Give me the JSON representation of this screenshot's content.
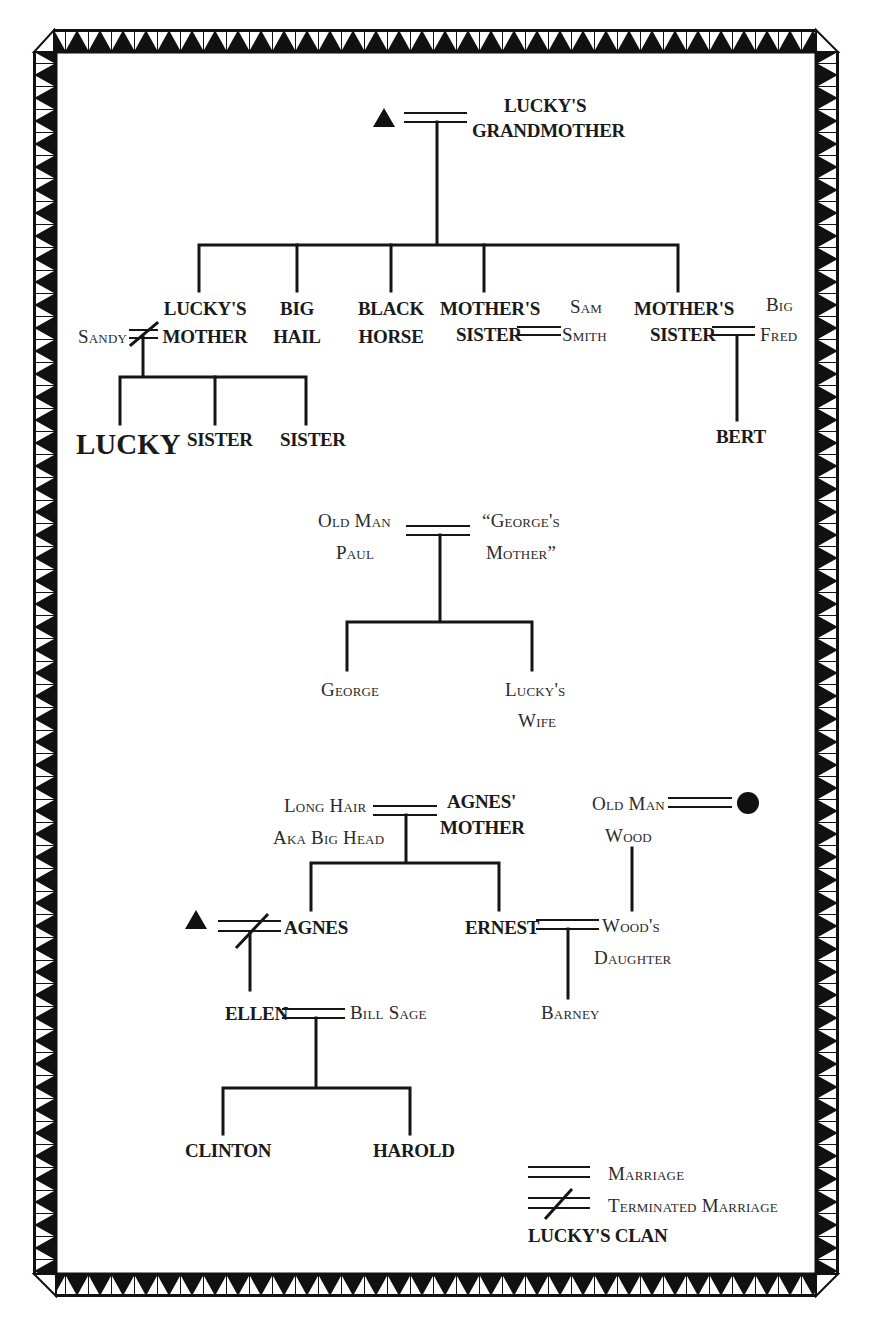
{
  "legend": {
    "marriage": "Marriage",
    "terminated_marriage": "Terminated Marriage",
    "clan": "LUCKY'S CLAN"
  },
  "colors": {
    "ink": "#151515",
    "background": "#ffffff"
  },
  "tree1": {
    "founder_male_symbol": "triangle",
    "grandmother": [
      "LUCKY'S",
      "GRANDMOTHER"
    ],
    "children": {
      "luckys_mother": [
        "LUCKY'S",
        "MOTHER"
      ],
      "big_hail": [
        "BIG",
        "HAIL"
      ],
      "black_horse": [
        "BLACK",
        "HORSE"
      ],
      "mothers_sister_1": [
        "MOTHER'S",
        "SISTER"
      ],
      "mothers_sister_2": [
        "MOTHER'S",
        "SISTER"
      ]
    },
    "spouses": {
      "sandy": "Sandy",
      "sam_smith": [
        "Sam",
        "Smith"
      ],
      "big_fred": [
        "Big",
        "Fred"
      ]
    },
    "grandchildren": {
      "lucky": "LUCKY",
      "sister_1": "SISTER",
      "sister_2": "SISTER",
      "bert": "BERT"
    }
  },
  "tree2": {
    "old_man_paul": [
      "Old Man",
      "Paul"
    ],
    "georges_mother": [
      "“George's",
      "Mother”"
    ],
    "george": "George",
    "luckys_wife": [
      "Lucky's",
      "Wife"
    ]
  },
  "tree3": {
    "long_hair": [
      "Long Hair",
      "Aka Big Head"
    ],
    "agnes_mother": [
      "AGNES'",
      "MOTHER"
    ],
    "agnes": "AGNES",
    "ernest": "ERNEST",
    "old_man_wood": [
      "Old Man",
      "Wood"
    ],
    "woods_daughter": [
      "Wood's",
      "Daughter"
    ],
    "barney": "Barney",
    "ellen": "ELLEN",
    "bill_sage": "Bill Sage",
    "clinton": "CLINTON",
    "harold": "HAROLD",
    "female_symbol": "circle",
    "male_symbol": "triangle"
  }
}
